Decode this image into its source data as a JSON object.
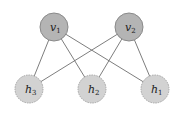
{
  "diagram": {
    "type": "bipartite-graph",
    "colors": {
      "visible_fill": "#b4b4b4",
      "visible_stroke": "#8a8a8a",
      "hidden_fill": "#d2d2d2",
      "hidden_stroke": "#a6a6a6",
      "edge": "#6e6e6e"
    },
    "visible_nodes": [
      {
        "id": "v1",
        "label": "v",
        "subscript": "1",
        "cx": 54,
        "cy": 27
      },
      {
        "id": "v2",
        "label": "v",
        "subscript": "2",
        "cx": 129,
        "cy": 27
      }
    ],
    "hidden_nodes": [
      {
        "id": "h3",
        "label": "h",
        "subscript": "3",
        "cx": 29,
        "cy": 89
      },
      {
        "id": "h2",
        "label": "h",
        "subscript": "2",
        "cx": 92,
        "cy": 89
      },
      {
        "id": "h1",
        "label": "h",
        "subscript": "1",
        "cx": 155,
        "cy": 89
      }
    ],
    "edges": [
      [
        "v1",
        "h3"
      ],
      [
        "v1",
        "h2"
      ],
      [
        "v1",
        "h1"
      ],
      [
        "v2",
        "h3"
      ],
      [
        "v2",
        "h2"
      ],
      [
        "v2",
        "h1"
      ]
    ]
  }
}
